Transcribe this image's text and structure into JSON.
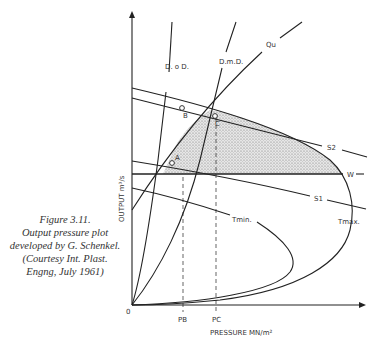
{
  "caption": {
    "lines": [
      "Figure 3.11.",
      "Output pressure plot",
      "developed by G. Schenkel.",
      "(Courtesy Int. Plast.",
      "Engng, July 1961)"
    ]
  },
  "axes": {
    "origin_label": "0",
    "x_label": "PRESSURE MN/m²",
    "y_label": "OUTPUT m³/s",
    "x_ticks": [
      "PB",
      "PC"
    ]
  },
  "curves": {
    "dod": "D. o D.",
    "dmd": "D.m.D.",
    "qu": "Qu",
    "s2": "S2",
    "s1": "S1",
    "w": "W",
    "tmin": "Tmin.",
    "tmax": "Tmax."
  },
  "points": {
    "a": "A",
    "b": "B",
    "c": "C"
  },
  "colors": {
    "line": "#222222",
    "shade": "#c8c8c8",
    "text": "#333333"
  }
}
